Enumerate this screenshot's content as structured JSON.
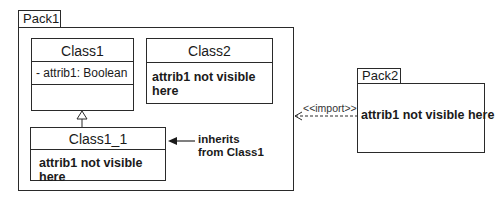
{
  "packages": [
    {
      "id": "pack1",
      "name": "Pack1"
    },
    {
      "id": "pack2",
      "name": "Pack2",
      "body_text": "attrib1 not visible here"
    }
  ],
  "classes": [
    {
      "id": "class1",
      "name": "Class1",
      "attributes": [
        "- attrib1: Boolean"
      ]
    },
    {
      "id": "class2",
      "name": "Class2",
      "body_text": "attrib1 not visible here"
    },
    {
      "id": "class1_1",
      "name": "Class1_1",
      "body_text": "attrib1 not visible here"
    }
  ],
  "relations": [
    {
      "type": "generalization",
      "from": "Class1_1",
      "to": "Class1"
    },
    {
      "type": "import",
      "from": "Pack2",
      "to": "Pack1",
      "label": "<<import>>"
    }
  ],
  "annotations": {
    "inherits_line1": "inherits",
    "inherits_line2": "from Class1"
  },
  "colors": {
    "line": "#2a2a2a",
    "background": "#ffffff"
  }
}
